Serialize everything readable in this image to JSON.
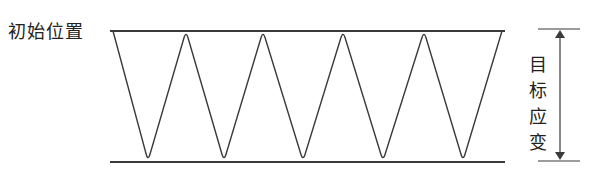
{
  "diagram": {
    "initial_position_label": "初始位置",
    "target_strain_label": [
      "目",
      "标",
      "应",
      "变"
    ],
    "colors": {
      "line": "#3a3a3a",
      "text": "#222222",
      "background": "#ffffff"
    },
    "waveform": {
      "type": "triangular-cyclic-strain",
      "top_y": 31,
      "bottom_y": 162,
      "x_start": 110,
      "x_end": 505,
      "peaks_x": [
        113,
        186,
        263,
        343,
        424,
        502
      ],
      "troughs_x": [
        148,
        224,
        303,
        383,
        463
      ],
      "cycles": 5
    },
    "dimension_arrow": {
      "x": 560,
      "top_y": 29,
      "bottom_y": 161,
      "tick_x_start": 538,
      "tick_x_end": 580
    }
  }
}
